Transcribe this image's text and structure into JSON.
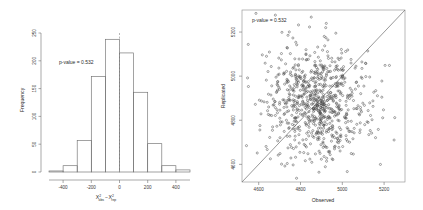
{
  "figure": {
    "background_color": "#ffffff",
    "line_color": "#6e6e6e",
    "point_color": "#4a4a4a"
  },
  "chart_data": [
    {
      "type": "bar",
      "panel_name": "posterior-predictive-histogram",
      "title": "",
      "xlabel": "X obs - X rep",
      "xlabel_parts": {
        "first_symbol": "X",
        "first_sup": "2",
        "first_sub": "obs",
        "operator": "−",
        "second_symbol": "X",
        "second_sup": "2",
        "second_sub": "rep"
      },
      "ylabel": "Frequency",
      "annotation": "p-value = 0.532",
      "xlim": [
        -500,
        500
      ],
      "ylim": [
        0,
        265
      ],
      "xticks": [
        -400,
        -200,
        0,
        200,
        400
      ],
      "xticklabels": [
        "-400",
        "-200",
        "0",
        "200",
        "400"
      ],
      "yticks": [
        0,
        50,
        100,
        150,
        200,
        250
      ],
      "yticklabels": [
        "0",
        "50",
        "100",
        "150",
        "200",
        "250"
      ],
      "grid": false,
      "bin_width": 100,
      "bin_edges": [
        -500,
        -400,
        -300,
        -200,
        -100,
        0,
        100,
        200,
        300,
        400,
        500
      ],
      "bin_centers": [
        -450,
        -350,
        -250,
        -150,
        -50,
        50,
        150,
        250,
        350,
        450
      ],
      "values": [
        2,
        12,
        60,
        182,
        253,
        227,
        152,
        54,
        12,
        4
      ],
      "reference_line_x": 0,
      "reference_line_style": "dashed"
    },
    {
      "type": "scatter",
      "panel_name": "observed-vs-replicated-scatter",
      "title": "",
      "xlabel": "Observed",
      "ylabel": "Replicated",
      "annotation": "p-value = 0.532",
      "xlim": [
        4520,
        5300
      ],
      "ylim": [
        4520,
        5300
      ],
      "xticks": [
        4600,
        4800,
        5000,
        5200
      ],
      "xticklabels": [
        "4600",
        "4800",
        "5000",
        "5200"
      ],
      "yticks": [
        4600,
        4800,
        5000,
        5200
      ],
      "yticklabels": [
        "4600",
        "4800",
        "5000",
        "5200"
      ],
      "grid": false,
      "marker": "open-circle",
      "identity_line": true,
      "n_points": 800,
      "center": [
        4880,
        4880
      ],
      "spread": 125
    }
  ]
}
